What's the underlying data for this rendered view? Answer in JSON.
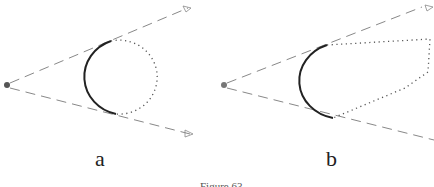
{
  "figure": {
    "panels": [
      {
        "id": "a",
        "label": "a",
        "shape": "circle"
      },
      {
        "id": "b",
        "label": "b",
        "shape": "polygon"
      }
    ],
    "caption": "Figure 63"
  },
  "colors": {
    "solid_arc": "#222222",
    "dashed_ray": "#888888",
    "dotted_outline": "#555555",
    "point": "#555555"
  }
}
